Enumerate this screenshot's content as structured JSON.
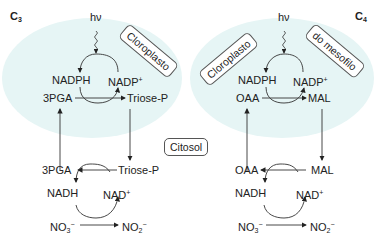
{
  "left": {
    "title": "C",
    "title_sub": "3",
    "light": "hν",
    "compartment": "Cloroplasto",
    "chloro": {
      "nadph": "NADPH",
      "nadp": "NADP",
      "nadp_sup": "+",
      "substrate": "3PGA",
      "product": "Triose-P"
    },
    "cytosol": {
      "product": "3PGA",
      "substrate": "Triose-P",
      "nadh": "NADH",
      "nad": "NAD",
      "nad_sup": "+",
      "no3": "NO",
      "no3_sub": "3",
      "no3_sup": "−",
      "no2": "NO",
      "no2_sub": "2",
      "no2_sup": "−"
    }
  },
  "right": {
    "title": "C",
    "title_sub": "4",
    "light": "hν",
    "compartment_1": "Cloroplasto",
    "compartment_2": "do mesofilo",
    "chloro": {
      "nadph": "NADPH",
      "nadp": "NADP",
      "nadp_sup": "+",
      "substrate": "OAA",
      "product": "MAL"
    },
    "cytosol": {
      "product": "OAA",
      "substrate": "MAL",
      "nadh": "NADH",
      "nad": "NAD",
      "nad_sup": "+",
      "no3": "NO",
      "no3_sub": "3",
      "no3_sup": "−",
      "no2": "NO",
      "no2_sub": "2",
      "no2_sup": "−"
    }
  },
  "center": {
    "cytosol_label": "Citosol"
  },
  "colors": {
    "chloroplast_fill": "#e6f5f5",
    "line": "#333333"
  }
}
